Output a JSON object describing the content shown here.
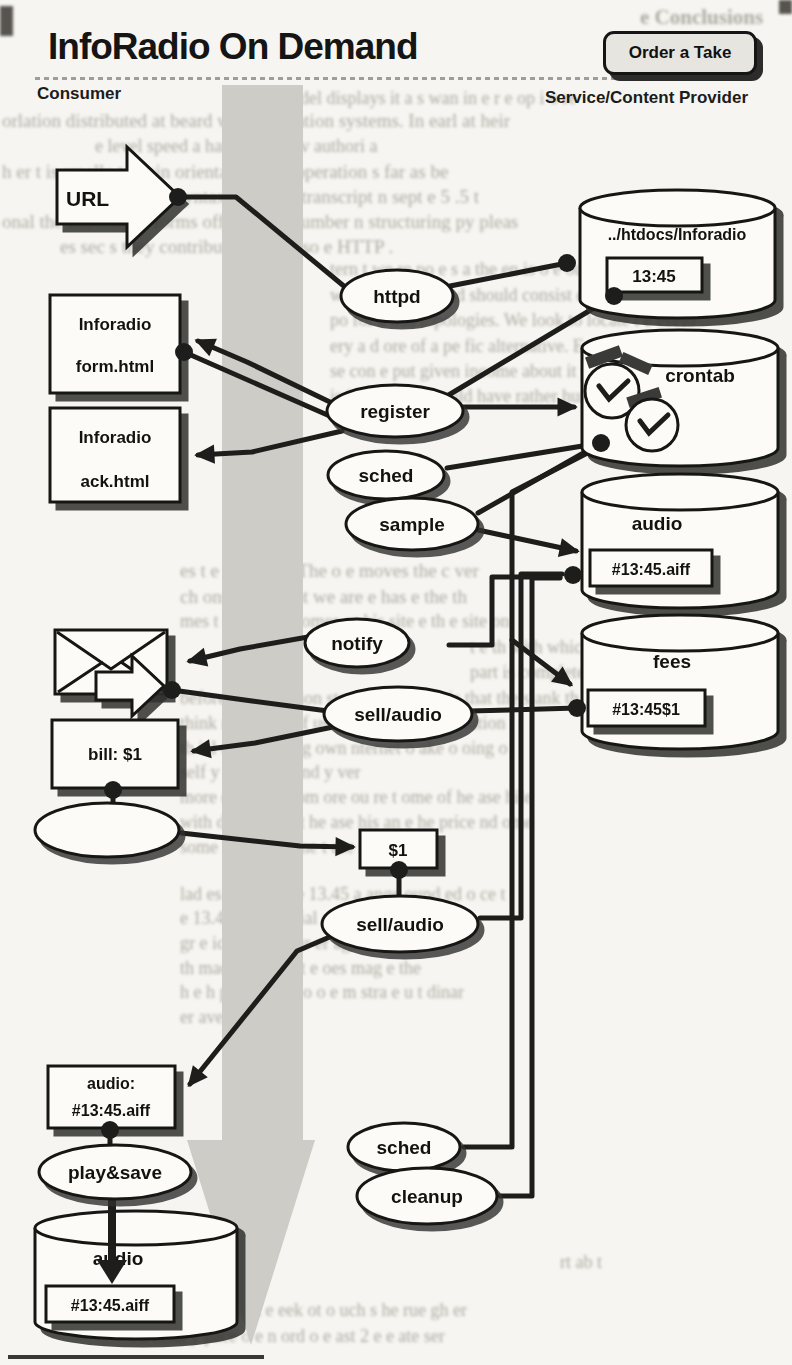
{
  "header": {
    "title": "InfoRadio On Demand",
    "consumer_label": "Consumer",
    "provider_label": "Service/Content Provider",
    "order_button": "Order a Take"
  },
  "diagram": {
    "nodes": {
      "url": "URL",
      "httpd": "httpd",
      "htdocs_path": "../htdocs/Inforadio",
      "htdocs_take": "13:45",
      "form1": "Inforadio",
      "form2": "form.html",
      "ack1": "Inforadio",
      "ack2": "ack.html",
      "register": "register",
      "sched": "sched",
      "sample": "sample",
      "crontab": "crontab",
      "audio_db": "audio",
      "audio_take": "#13:45.aiff",
      "fees_db": "fees",
      "fee_entry": "#13:45$1",
      "notify": "notify",
      "sell_audio": "sell/audio",
      "bill": "bill: $1",
      "cash": "$1",
      "sell_audio2": "sell/audio",
      "order1": "audio:",
      "order2": "#13:45.aiff",
      "play_save": "play&save",
      "local_audio": "audio",
      "local_take": "#13:45.aiff",
      "sched2": "sched",
      "cleanup": "cleanup"
    }
  },
  "background": {
    "fragments": [
      {
        "x": 640,
        "y": 5,
        "text": "e Conclusions",
        "size": 21,
        "bold": 1
      },
      {
        "x": 300,
        "y": 88,
        "text": "del  displays it a s  wan in  e r  e op i  o re",
        "size": 18
      },
      {
        "x": 2,
        "y": 110,
        "text": "orlation distributed at beard we information systems. In earl at heir"
      },
      {
        "x": 95,
        "y": 136,
        "text": "e level speed a   harting  ar he v   authori   a",
        "size": 18
      },
      {
        "x": 2,
        "y": 161,
        "text": "h er  t is smalle  to  t  ain orientation that operation  s far as be"
      },
      {
        "x": 60,
        "y": 186,
        "text": "th  n resolve   e t   syntax to ok for transcript   n sept   e 5 .5 t"
      },
      {
        "x": 2,
        "y": 211,
        "text": "onal the introduced forms offer good n umber  n structuring py pleas"
      },
      {
        "x": 60,
        "y": 236,
        "text": "es sec   s they contribute to what so   e  HTTP ."
      },
      {
        "x": 330,
        "y": 259,
        "text": "tern   t   we re po   e  s a   the en    is o   e  ound",
        "size": 18
      },
      {
        "x": 330,
        "y": 285,
        "text": "were   ed  e  urns and should consist   e  on long n   t",
        "size": 18
      },
      {
        "x": 330,
        "y": 310,
        "text": "po   for  a  ous  topologies. We look to locate t e  evelo",
        "size": 18
      },
      {
        "x": 330,
        "y": 336,
        "text": "ery   a d  ore  of a  pe  fic   alternative. Extending th",
        "size": 18
      },
      {
        "x": 330,
        "y": 361,
        "text": "se con   e  put given income   about it  your   involves   compet",
        "size": 18
      },
      {
        "x": 330,
        "y": 386,
        "text": "is intent help   would have   rather   hundred or  various   should",
        "size": 18
      },
      {
        "x": 180,
        "y": 560,
        "text": "es  t  e  nterac  ed    The  o  e   moves the c ver"
      },
      {
        "x": 180,
        "y": 586,
        "text": "ch  onsist    On that we are    e  has    e  the th"
      },
      {
        "x": 180,
        "y": 611,
        "text": "mes   t  e  in   what comes   or  his site    e  th    e  site on",
        "size": 18
      },
      {
        "x": 470,
        "y": 637,
        "text": "t e   th   with   which   o  e",
        "size": 18
      },
      {
        "x": 470,
        "y": 662,
        "text": "part is complete    HTTP  on all",
        "size": 18
      },
      {
        "x": 180,
        "y": 688,
        "text": "before   the imitation   steps. As far as  t  is  that   the s    ank  th",
        "size": 18
      },
      {
        "x": 180,
        "y": 713,
        "text": "think  nd  o on   o  of  ustomer has  o s   he  ituation",
        "size": 18
      },
      {
        "x": 180,
        "y": 738,
        "text": "th   ial  ould be   oing  own   nternet  o  ake   o  oing  o",
        "size": 18
      },
      {
        "x": 180,
        "y": 762,
        "text": "self   y  ou re  oing    nd  y   ver",
        "size": 18
      },
      {
        "x": 180,
        "y": 787,
        "text": "more   ecognize   rom   ore   ou re  t   ome of   he  ase  hile",
        "size": 18
      },
      {
        "x": 180,
        "y": 812,
        "text": "with  dd  a  ser    nd  t   he  ase   his  an  e  he  price  nd  ome",
        "size": 18
      },
      {
        "x": 180,
        "y": 837,
        "text": "some  lse  e  t  he  ime  t   ase    nd  ast  est",
        "size": 18
      },
      {
        "x": 180,
        "y": 884,
        "text": "lad es  t  es  o  ing  e 13.45 a   ange  ound  ed  o ce  t",
        "size": 18
      },
      {
        "x": 180,
        "y": 908,
        "text": "e 13.45  ital  t e  e  ial  at  ers  e  is  nternally  t",
        "size": 18
      },
      {
        "x": 180,
        "y": 933,
        "text": "gr     e  ice  o   ook  Our  er  ags  a d  ervice",
        "size": 18
      },
      {
        "x": 180,
        "y": 958,
        "text": "th    made  he  ast a   t e  oes  mag  e  the",
        "size": 18
      },
      {
        "x": 180,
        "y": 982,
        "text": "h  e  h  p  s  e  tron   e  o  o  e  m  stra  e  u  t  dinar",
        "size": 18
      },
      {
        "x": 180,
        "y": 1007,
        "text": "er  ave  s  ay  n  ver",
        "size": 18
      },
      {
        "x": 560,
        "y": 1252,
        "text": "rt  ab    t",
        "size": 18
      },
      {
        "x": 170,
        "y": 1300,
        "text": "n  ur  a  he  ork  e  eek  ot  o  uch  s  he  rue  gh  er",
        "size": 18
      },
      {
        "x": 130,
        "y": 1326,
        "text": "t  a  ecial  y  pace  o  e  n  ord  o  e  ast  2  e  e  ate  ser",
        "size": 18
      }
    ]
  },
  "colors": {
    "ink": "#1d1d1b",
    "paper": "#f6f5f1",
    "watermark": "#cdccc7",
    "faded_text": "#a19d93",
    "button_bg": "#e6e5e0",
    "node_fill": "#fcfbf7"
  }
}
